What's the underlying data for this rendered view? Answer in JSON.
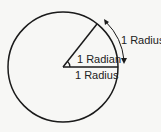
{
  "diagram": {
    "labels": {
      "arc_label": "1 Radius",
      "angle_label": "1 Radian",
      "base_label": "1 Radius"
    },
    "colors": {
      "stroke": "#1a1a1a",
      "background": "#f7f7f5"
    }
  }
}
